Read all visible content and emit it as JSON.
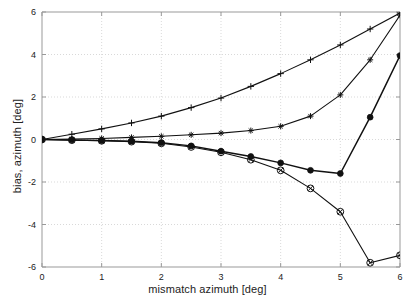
{
  "figure": {
    "background": "#ffffff",
    "axis_color": "#999999",
    "grid_color": "#cfcfcf",
    "line_color": "#111111"
  },
  "chart_data": {
    "type": "line",
    "title": "",
    "xlabel": "mismatch azimuth [deg]",
    "ylabel": "bias, azimuth [deg]",
    "xlim": [
      0,
      6
    ],
    "ylim": [
      -6,
      6
    ],
    "xticks": [
      0,
      1,
      2,
      3,
      4,
      5,
      6
    ],
    "yticks": [
      -6,
      -4,
      -2,
      0,
      2,
      4,
      6
    ],
    "xticklabels": [
      "0",
      "1",
      "2",
      "3",
      "4",
      "5",
      "6"
    ],
    "yticklabels": [
      "-6",
      "-4",
      "-2",
      "0",
      "2",
      "4",
      "6"
    ],
    "grid": true,
    "grid_style": "dotted",
    "legend": null,
    "x": [
      0,
      0.5,
      1,
      1.5,
      2,
      2.5,
      3,
      3.5,
      4,
      4.5,
      5,
      5.5,
      6
    ],
    "series": [
      {
        "name": "plus-curve",
        "marker": "plus",
        "values": [
          0.0,
          0.25,
          0.5,
          0.78,
          1.1,
          1.5,
          1.95,
          2.5,
          3.1,
          3.75,
          4.45,
          5.2,
          5.95
        ]
      },
      {
        "name": "asterisk-curve",
        "marker": "asterisk",
        "values": [
          0.0,
          0.02,
          0.05,
          0.1,
          0.15,
          0.22,
          0.3,
          0.42,
          0.62,
          1.1,
          2.1,
          3.75,
          5.85
        ]
      },
      {
        "name": "filled-dot-curve",
        "marker": "filled-circle",
        "values": [
          0.0,
          -0.02,
          -0.05,
          -0.08,
          -0.15,
          -0.3,
          -0.55,
          -0.8,
          -1.1,
          -1.45,
          -1.6,
          1.05,
          3.95
        ]
      },
      {
        "name": "circle-x-curve",
        "marker": "circle-x",
        "values": [
          0.0,
          -0.03,
          -0.06,
          -0.1,
          -0.18,
          -0.35,
          -0.6,
          -0.95,
          -1.45,
          -2.3,
          -3.4,
          -5.8,
          -5.45
        ]
      }
    ]
  }
}
